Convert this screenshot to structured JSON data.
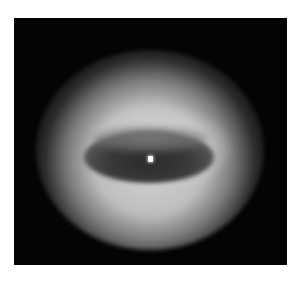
{
  "image": {
    "description": "Grayscale image of a bright elliptical ring (doughnut-shaped glow) with a darker elliptical center and a small bright spot, on a black square background",
    "colors": {
      "page_background": "#ffffff",
      "frame_background": "#040404",
      "ring_highlight": "#d7d7d7",
      "center_dark": "#2a2a2a",
      "bright_spot": "#ffffff"
    }
  }
}
